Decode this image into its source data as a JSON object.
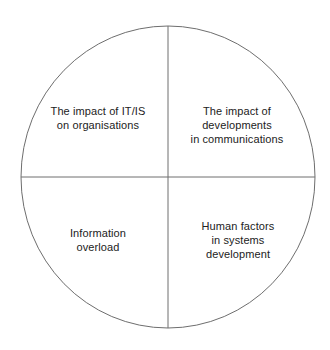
{
  "diagram": {
    "title": "",
    "shape": "circle-quadrants",
    "colors": {
      "background": "#ffffff",
      "stroke": "#6e6e6e",
      "text": "#222222"
    },
    "geometry": {
      "center_x": 168,
      "center_y": 177,
      "radius_x": 147,
      "radius_y": 151,
      "stroke_width": 1
    },
    "quadrants": [
      {
        "position": "top-left",
        "label": "The impact of IT/IS\non organisations"
      },
      {
        "position": "top-right",
        "label": "The impact of\ndevelopments\nin communications"
      },
      {
        "position": "bottom-left",
        "label": "Information\noverload"
      },
      {
        "position": "bottom-right",
        "label": "Human factors\nin systems\ndevelopment"
      }
    ]
  }
}
